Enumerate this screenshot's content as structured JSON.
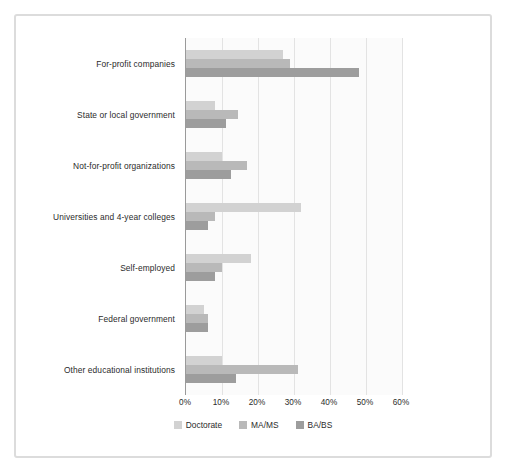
{
  "chart_data": {
    "type": "bar",
    "orientation": "horizontal",
    "title": "",
    "xlabel": "",
    "ylabel": "",
    "xlim": [
      0,
      60
    ],
    "xticks": [
      "0%",
      "10%",
      "20%",
      "30%",
      "40%",
      "50%",
      "60%"
    ],
    "xtick_values": [
      0,
      10,
      20,
      30,
      40,
      50,
      60
    ],
    "grid": true,
    "legend_position": "bottom",
    "categories": [
      "For-profit companies",
      "State or local government",
      "Not-for-profit organizations",
      "Universities and 4-year colleges",
      "Self-employed",
      "Federal government",
      "Other educational institutions"
    ],
    "series": [
      {
        "name": "Doctorate",
        "color": "#d2d2d2",
        "values": [
          27,
          8,
          10,
          32,
          18,
          5,
          10
        ]
      },
      {
        "name": "MA/MS",
        "color": "#b9b9b9",
        "values": [
          29,
          14.5,
          17,
          8,
          10,
          6,
          31
        ]
      },
      {
        "name": "BA/BS",
        "color": "#9d9d9d",
        "values": [
          48,
          11,
          12.5,
          6,
          8,
          6,
          14
        ]
      }
    ]
  },
  "colors": {
    "frame_border": "#dcdcdc",
    "plot_background": "#fbfbfb",
    "axis_line": "#9a9a9a",
    "gridline": "#e3e3e3",
    "text": "#2b2b2b"
  }
}
